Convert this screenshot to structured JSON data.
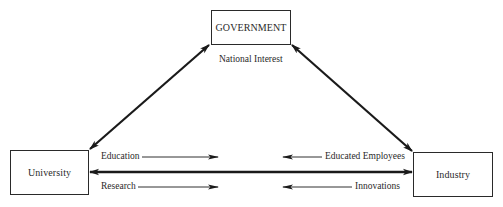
{
  "diagram": {
    "type": "flow-triangle",
    "nodes": {
      "government": {
        "label": "GOVERNMENT"
      },
      "university": {
        "label": "University"
      },
      "industry": {
        "label": "Industry"
      }
    },
    "edges": {
      "university_government": {
        "direction": "bidirectional",
        "label": ""
      },
      "government_industry": {
        "direction": "bidirectional",
        "label": ""
      },
      "university_industry": {
        "direction": "bidirectional",
        "label": ""
      }
    },
    "labels": {
      "national_interest": "National Interest",
      "education": "Education",
      "research": "Research",
      "educated_employees": "Educated Employees",
      "innovations": "Innovations"
    },
    "flows": [
      {
        "label": "Education",
        "from": "university",
        "to": "industry"
      },
      {
        "label": "Research",
        "from": "university",
        "to": "industry"
      },
      {
        "label": "Educated Employees",
        "from": "industry",
        "to": "university"
      },
      {
        "label": "Innovations",
        "from": "industry",
        "to": "university"
      }
    ],
    "colors": {
      "stroke": "#1a1a1a",
      "box_border": "#2a2a2a",
      "background": "#ffffff"
    }
  }
}
